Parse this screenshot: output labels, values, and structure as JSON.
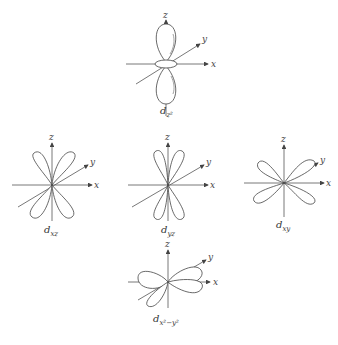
{
  "figure": {
    "title": "",
    "orbitals": [
      {
        "id": "dz2",
        "label_main": "d",
        "label_sub": "z²",
        "center": [
          166,
          64
        ]
      },
      {
        "id": "dxz",
        "label_main": "d",
        "label_sub": "xz",
        "center": [
          52,
          185
        ]
      },
      {
        "id": "dyz",
        "label_main": "d",
        "label_sub": "yz",
        "center": [
          168,
          185
        ]
      },
      {
        "id": "dxy",
        "label_main": "d",
        "label_sub": "xy",
        "center": [
          284,
          183
        ]
      },
      {
        "id": "dx2-y2",
        "label_main": "d",
        "label_sub": "x²−y²",
        "center": [
          168,
          282
        ]
      }
    ],
    "axes": {
      "x": "x",
      "y": "y",
      "z": "z"
    }
  }
}
